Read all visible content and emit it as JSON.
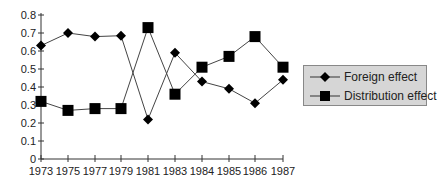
{
  "chart_data": {
    "type": "line",
    "title": "",
    "xlabel": "",
    "ylabel": "",
    "categories": [
      "1973",
      "1975",
      "1977",
      "1979",
      "1981",
      "1983",
      "1984",
      "1985",
      "1986",
      "1987"
    ],
    "series": [
      {
        "name": "Foreign effect",
        "marker": "diamond",
        "values": [
          0.63,
          0.7,
          0.68,
          0.685,
          0.22,
          0.59,
          0.43,
          0.39,
          0.31,
          0.44
        ]
      },
      {
        "name": "Distribution effect",
        "marker": "square",
        "values": [
          0.32,
          0.27,
          0.28,
          0.28,
          0.73,
          0.36,
          0.51,
          0.57,
          0.68,
          0.51
        ]
      }
    ],
    "ylim": [
      0,
      0.8
    ],
    "yticks": [
      "0",
      "0.1",
      "0.2",
      "0.3",
      "0.4",
      "0.5",
      "0.6",
      "0.7",
      "0.8"
    ],
    "grid": false,
    "legend_position": "right"
  },
  "legend": {
    "items": [
      {
        "label": "Foreign effect"
      },
      {
        "label": "Distribution effect"
      }
    ]
  }
}
